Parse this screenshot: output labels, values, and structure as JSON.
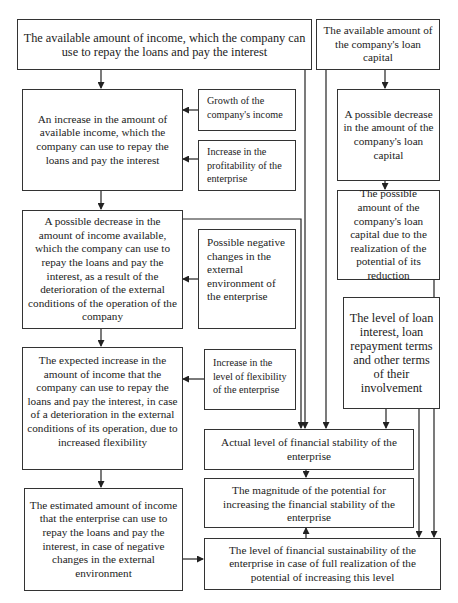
{
  "diagram": {
    "boxes": {
      "available_income": "The available amount of income, which the company can use to repay the loans and pay the interest",
      "available_loan_capital": "The available amount of the company's loan capital",
      "increase_available_income": "An increase in the amount of available income, which the company can use to repay the loans and pay the interest",
      "growth_income": "Growth of the company's income",
      "increase_profitability": "Increase in the profitability of the enterprise",
      "decrease_loan_capital": "A possible decrease in the amount of the company's loan capital",
      "possible_loan_capital": "The possible amount of the company's loan capital due to the realization of the potential of its reduction",
      "decrease_income": "A possible decrease in the amount of income available, which the company can use to repay the loans and pay the interest, as a result of the deterioration of the external conditions of the operation of the company",
      "negative_changes": "Possible negative changes in the external environment of the enterprise",
      "loan_interest_level": "The level of loan interest, loan repayment terms and other terms of their involvement",
      "expected_increase": "The expected increase in the amount of income that the company can use to repay the loans and pay the interest, in case of a deterioration in the external conditions of its operation, due to increased flexibility",
      "increase_flexibility": "Increase in the level of flexibility of the enterprise",
      "actual_stability": "Actual level of financial stability of the enterprise",
      "potential_magnitude": "The magnitude of the potential for increasing the financial stability of the enterprise",
      "estimated_amount": "The estimated amount of income that the enterprise can use to repay the loans and pay the interest, in case of negative changes in the external environment",
      "sustainability_level": "The level of financial sustainability of the enterprise in case of full realization of the potential of increasing this level"
    },
    "colors": {
      "line": "#222222",
      "border": "#333333",
      "background": "#ffffff"
    }
  }
}
